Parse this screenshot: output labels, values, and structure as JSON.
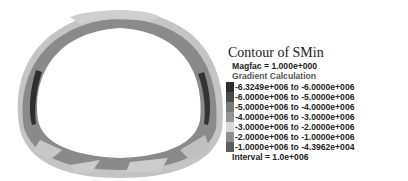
{
  "figure": {
    "fill_colors": {
      "outer_light": "#c8c8c8",
      "main_band": "#8c8c8c",
      "mid_band": "#9e9e9e",
      "dark_inner": "#3a3a3a"
    }
  },
  "legend": {
    "title": "Contour of SMin",
    "magfac": "Magfac =  1.000e+000",
    "calc": "Gradient Calculation",
    "rows": [
      {
        "label": "-6.3249e+006 to -6.0000e+006",
        "color": "#2c2c2c"
      },
      {
        "label": "-6.0000e+006 to -5.0000e+006",
        "color": "#4a4a4a"
      },
      {
        "label": "-5.0000e+006 to -4.0000e+006",
        "color": "#7a7a7a"
      },
      {
        "label": "-4.0000e+006 to -3.0000e+006",
        "color": "#949494"
      },
      {
        "label": "-3.0000e+006 to -2.0000e+006",
        "color": "#d8d8d8"
      },
      {
        "label": "-2.0000e+006 to -1.0000e+006",
        "color": "#8e8e8e"
      },
      {
        "label": "-1.0000e+006 to -4.3962e+004",
        "color": "#5e5e5e"
      }
    ],
    "interval": "Interval =  1.0e+006"
  }
}
